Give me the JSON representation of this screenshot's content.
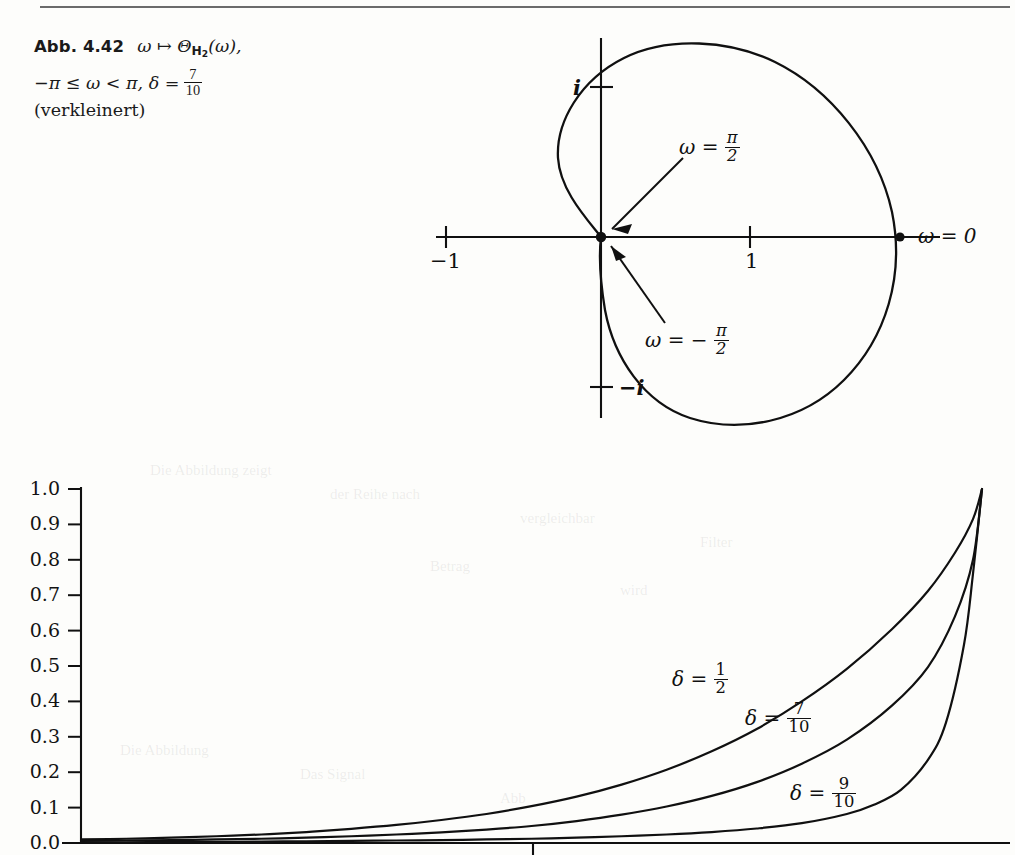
{
  "page": {
    "width": 1015,
    "height": 855,
    "background": "#fdfdfb",
    "ink": "#101010"
  },
  "caption": {
    "figure_label": "Abb. 4.42",
    "line1_map": "ω ↦ Θ",
    "line1_sub": "H",
    "line1_sub2": "2",
    "line1_arg": "(ω),",
    "line2_range": "−π ≤ ω < π, δ =",
    "line2_frac_num": "7",
    "line2_frac_den": "10",
    "line3": "(verkleinert)"
  },
  "polar_figure": {
    "title_symbols": {
      "omega_zero": "ω = 0",
      "omega_plus_half_pi": "ω =",
      "omega_minus_half_pi": "ω = −",
      "pi": "π",
      "two": "2"
    },
    "axis_ticks": [
      {
        "name": "minus-one",
        "label": "−1",
        "x": -1,
        "y": 0
      },
      {
        "name": "one",
        "label": "1",
        "x": 1,
        "y": 0
      },
      {
        "name": "i",
        "label": "i",
        "x": 0,
        "y": 1
      },
      {
        "name": "minus-i",
        "label": "−i",
        "x": 0,
        "y": -1
      }
    ],
    "marked_points": [
      {
        "name": "omega-zero-point",
        "x": 2.0,
        "y": 0.0
      },
      {
        "name": "origin-point",
        "x": 0.0,
        "y": 0.0
      }
    ],
    "delta": 0.7,
    "curve_description": "Nyquist locus of H2, cardioid-like loop through origin"
  },
  "chart_data": {
    "type": "line",
    "title": "",
    "xlabel": "",
    "ylabel": "",
    "ylim": [
      0.0,
      1.0
    ],
    "xlim": [
      0,
      1
    ],
    "grid": false,
    "legend_position": "inline-annotation",
    "ytick_labels": [
      "1.0",
      "0.9",
      "0.8",
      "0.7",
      "0.6",
      "0.5",
      "0.4",
      "0.3",
      "0.2",
      "0.1",
      "0.0"
    ],
    "ytick_values": [
      1.0,
      0.9,
      0.8,
      0.7,
      0.6,
      0.5,
      0.4,
      0.3,
      0.2,
      0.1,
      0.0
    ],
    "xtick_values": [
      0.5
    ],
    "xtick_labels": [
      ""
    ],
    "series": [
      {
        "name": "delta-one-half",
        "label_prefix": "δ =",
        "label_num": "1",
        "label_den": "2",
        "delta": 0.5,
        "x": [
          0.0,
          0.05,
          0.1,
          0.15,
          0.2,
          0.25,
          0.3,
          0.35,
          0.4,
          0.45,
          0.5,
          0.55,
          0.6,
          0.65,
          0.7,
          0.75,
          0.8,
          0.85,
          0.9,
          0.94,
          0.97,
          0.99,
          1.0
        ],
        "values": [
          0.01,
          0.012,
          0.015,
          0.019,
          0.024,
          0.031,
          0.04,
          0.051,
          0.065,
          0.082,
          0.104,
          0.131,
          0.165,
          0.207,
          0.259,
          0.322,
          0.4,
          0.492,
          0.604,
          0.712,
          0.82,
          0.915,
          1.0
        ]
      },
      {
        "name": "delta-seven-tenths",
        "label_prefix": "δ =",
        "label_num": "7",
        "label_den": "10",
        "delta": 0.7,
        "x": [
          0.0,
          0.05,
          0.1,
          0.15,
          0.2,
          0.25,
          0.3,
          0.35,
          0.4,
          0.45,
          0.5,
          0.55,
          0.6,
          0.65,
          0.7,
          0.75,
          0.8,
          0.85,
          0.9,
          0.94,
          0.97,
          0.99,
          1.0
        ],
        "values": [
          0.006,
          0.007,
          0.008,
          0.01,
          0.012,
          0.015,
          0.019,
          0.024,
          0.03,
          0.038,
          0.048,
          0.062,
          0.08,
          0.103,
          0.133,
          0.172,
          0.224,
          0.292,
          0.388,
          0.497,
          0.64,
          0.8,
          1.0
        ]
      },
      {
        "name": "delta-nine-tenths",
        "label_prefix": "δ =",
        "label_num": "9",
        "label_den": "10",
        "delta": 0.9,
        "x": [
          0.0,
          0.05,
          0.1,
          0.15,
          0.2,
          0.25,
          0.3,
          0.35,
          0.4,
          0.45,
          0.5,
          0.55,
          0.6,
          0.65,
          0.7,
          0.75,
          0.8,
          0.85,
          0.88,
          0.91,
          0.94,
          0.96,
          0.98,
          0.99,
          1.0
        ],
        "values": [
          0.002,
          0.002,
          0.003,
          0.003,
          0.004,
          0.005,
          0.006,
          0.007,
          0.008,
          0.01,
          0.012,
          0.015,
          0.019,
          0.024,
          0.031,
          0.041,
          0.056,
          0.082,
          0.108,
          0.15,
          0.235,
          0.34,
          0.56,
          0.76,
          1.0
        ]
      }
    ]
  },
  "background_bleed": [
    {
      "text": "Die Abbildung zeigt",
      "x": 150,
      "y": 462
    },
    {
      "text": "der Reihe nach",
      "x": 330,
      "y": 486
    },
    {
      "text": "vergleichbar",
      "x": 520,
      "y": 510
    },
    {
      "text": "Filter",
      "x": 700,
      "y": 534
    },
    {
      "text": "Betrag",
      "x": 430,
      "y": 558
    },
    {
      "text": "wird",
      "x": 620,
      "y": 582
    },
    {
      "text": "Die Abbildung",
      "x": 120,
      "y": 742
    },
    {
      "text": "Das Signal",
      "x": 300,
      "y": 766
    },
    {
      "text": "Abb",
      "x": 500,
      "y": 790
    }
  ]
}
